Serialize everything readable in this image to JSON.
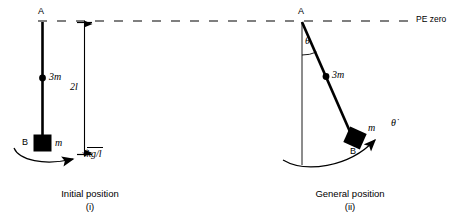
{
  "figure": {
    "type": "physics-diagram"
  },
  "datum_line": {
    "label": "PE zero",
    "style": "dashed"
  },
  "panel_left": {
    "pivot_label": "A",
    "end_label": "B",
    "rod_mass_label": "3m",
    "block_mass_label": "m",
    "dimension_label": "2l",
    "angular_velocity_label": "√(kg/l)",
    "sqrt_radicand": "kg/l",
    "caption_line1": "Initial position",
    "caption_line2": "(i)"
  },
  "panel_right": {
    "pivot_label": "A",
    "end_label": "B",
    "rod_mass_label": "3m",
    "block_mass_label": "m",
    "angle_label": "θ",
    "angular_rate_label": "θ̇",
    "caption_line1": "General position",
    "caption_line2": "(ii)"
  },
  "colors": {
    "ink": "#000000",
    "background": "#ffffff"
  }
}
